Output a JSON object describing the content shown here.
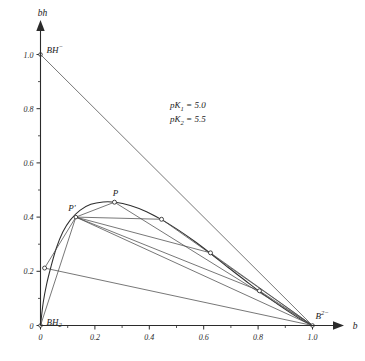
{
  "chart_data": {
    "type": "line",
    "title": "",
    "xlabel": "b",
    "ylabel": "bh",
    "xlim": [
      0,
      1.0
    ],
    "ylim": [
      0,
      1.0
    ],
    "grid": false,
    "legend": "none",
    "x_ticks": [
      "0",
      "0.2",
      "0.4",
      "0.6",
      "0.8",
      "1.0"
    ],
    "x_tick_values": [
      0,
      0.2,
      0.4,
      0.6,
      0.8,
      1.0
    ],
    "y_ticks": [
      "0",
      "0.2",
      "0.4",
      "0.6",
      "0.8",
      "1.0"
    ],
    "y_tick_values": [
      0,
      0.2,
      0.4,
      0.6,
      0.8,
      1.0
    ],
    "x_minor_tick_values": [
      0.1,
      0.3,
      0.5,
      0.7,
      0.9
    ],
    "y_minor_tick_values": [
      0.1,
      0.3,
      0.5,
      0.7,
      0.9
    ],
    "annotations": [
      {
        "name": "pk1",
        "text": "pK",
        "sub": "1",
        "value": "= 5.0"
      },
      {
        "name": "pk2",
        "text": "pK",
        "sub": "2",
        "value": "= 5.5"
      }
    ],
    "series": [
      {
        "name": "bh-curve",
        "kind": "curve",
        "points": [
          [
            0.0,
            0.0
          ],
          [
            0.01,
            0.085
          ],
          [
            0.022,
            0.15
          ],
          [
            0.038,
            0.215
          ],
          [
            0.058,
            0.285
          ],
          [
            0.082,
            0.345
          ],
          [
            0.11,
            0.39
          ],
          [
            0.145,
            0.425
          ],
          [
            0.185,
            0.447
          ],
          [
            0.23,
            0.456
          ],
          [
            0.275,
            0.455
          ],
          [
            0.33,
            0.443
          ],
          [
            0.39,
            0.42
          ],
          [
            0.45,
            0.388
          ],
          [
            0.51,
            0.35
          ],
          [
            0.57,
            0.308
          ],
          [
            0.63,
            0.262
          ],
          [
            0.69,
            0.214
          ],
          [
            0.75,
            0.168
          ],
          [
            0.81,
            0.122
          ],
          [
            0.87,
            0.08
          ],
          [
            0.925,
            0.043
          ],
          [
            0.965,
            0.018
          ],
          [
            1.0,
            0.0
          ]
        ]
      },
      {
        "name": "bh-minus-to-b2-line",
        "kind": "straight-line",
        "points": [
          [
            0.0,
            1.0
          ],
          [
            1.0,
            0.0
          ]
        ]
      }
    ],
    "fan_center": {
      "name": "P-prime",
      "label": "P'",
      "x": 0.13,
      "y": 0.4
    },
    "peak_point": {
      "name": "P",
      "label": "P",
      "x": 0.272,
      "y": 0.455
    },
    "curve_markers": [
      {
        "name": "marker-lower-left",
        "x": 0.015,
        "y": 0.212
      },
      {
        "name": "marker-peak-P",
        "x": 0.272,
        "y": 0.455
      },
      {
        "name": "marker-upper-right",
        "x": 0.445,
        "y": 0.392
      },
      {
        "name": "marker-mid-right",
        "x": 0.625,
        "y": 0.268
      },
      {
        "name": "marker-lower-right",
        "x": 0.805,
        "y": 0.128
      }
    ],
    "chords_from_fan_center": [
      {
        "name": "chord-to-lower-left",
        "to_x": 0.015,
        "to_y": 0.212
      },
      {
        "name": "chord-to-peak",
        "to_x": 0.272,
        "to_y": 0.455
      },
      {
        "name": "chord-to-upper-right",
        "to_x": 0.445,
        "to_y": 0.392
      },
      {
        "name": "chord-to-mid-right",
        "to_x": 0.625,
        "to_y": 0.268
      },
      {
        "name": "chord-to-lower-right",
        "to_x": 0.805,
        "to_y": 0.128
      },
      {
        "name": "chord-to-b2-minus",
        "to_x": 1.0,
        "to_y": 0.0
      }
    ],
    "tie_lines_to_b2_minus": [
      {
        "name": "tie-lower-left",
        "from_x": 0.015,
        "from_y": 0.212
      },
      {
        "name": "tie-peak",
        "from_x": 0.272,
        "from_y": 0.455
      },
      {
        "name": "tie-upper-right",
        "from_x": 0.445,
        "from_y": 0.392
      },
      {
        "name": "tie-mid-right",
        "from_x": 0.625,
        "from_y": 0.268
      },
      {
        "name": "tie-lower-right",
        "from_x": 0.805,
        "from_y": 0.128
      }
    ],
    "origin_spokes": [
      {
        "name": "spoke-origin-to-fan-center",
        "from_x": 0.0,
        "from_y": 0.0,
        "to_x": 0.13,
        "to_y": 0.4
      }
    ],
    "species_labels": [
      {
        "name": "species-bh2",
        "base": "BH",
        "sub": "2",
        "sup": "",
        "x": 0.0,
        "y": 0.0
      },
      {
        "name": "species-bh-minus",
        "base": "BH",
        "sub": "",
        "sup": "−",
        "x": 0.0,
        "y": 1.0
      },
      {
        "name": "species-b-2-minus",
        "base": "B",
        "sub": "",
        "sup": "2−",
        "x": 1.0,
        "y": 0.0
      }
    ]
  },
  "axes": {
    "x_axis_name": "b",
    "y_axis_name": "bh"
  },
  "colors": {
    "background": "#ffffff",
    "axis": "#2b2b2b",
    "curve": "#2e2e2e",
    "chord": "#4a4a4a",
    "text": "#1a1a1a"
  }
}
